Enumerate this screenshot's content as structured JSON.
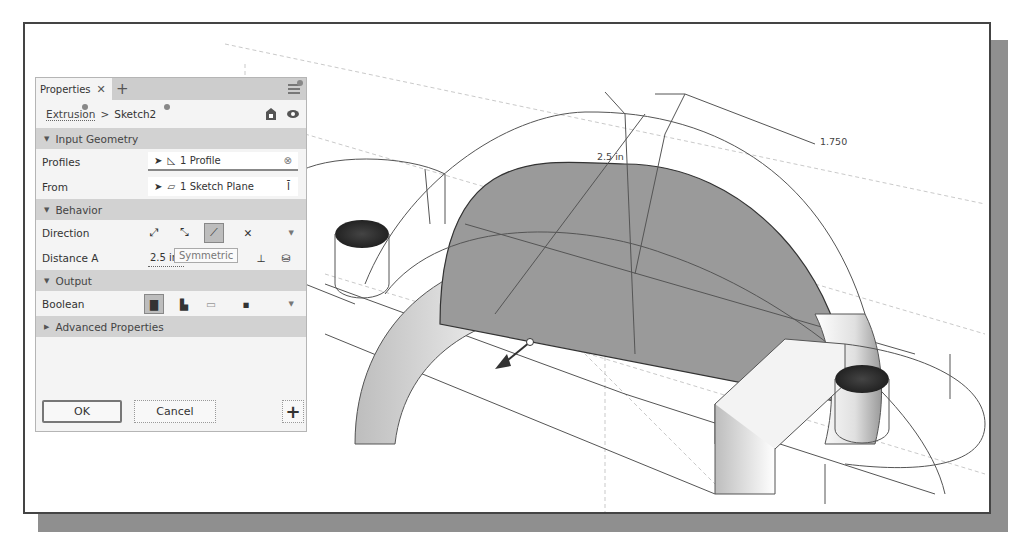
{
  "panel": {
    "tab_title": "Properties",
    "tab_close": "✕",
    "tab_add": "+",
    "breadcrumb": {
      "parent": "Extrusion",
      "separator": ">",
      "current": "Sketch2"
    },
    "sections": {
      "input_geometry": {
        "title": "Input Geometry",
        "profiles": {
          "label": "Profiles",
          "value": "1 Profile"
        },
        "from": {
          "label": "From",
          "value": "1 Sketch Plane"
        }
      },
      "behavior": {
        "title": "Behavior",
        "direction": {
          "label": "Direction",
          "options": [
            "default",
            "flipped",
            "symmetric",
            "asymmetric"
          ],
          "selected": "symmetric"
        },
        "distance_a": {
          "label": "Distance A",
          "value": "2.5 in",
          "tooltip": "Symmetric"
        }
      },
      "output": {
        "title": "Output",
        "boolean": {
          "label": "Boolean",
          "options": [
            "join",
            "cut",
            "intersect",
            "new-solid"
          ],
          "selected": "join"
        }
      },
      "advanced": {
        "title": "Advanced Properties"
      }
    },
    "buttons": {
      "ok": "OK",
      "cancel": "Cancel",
      "add": "+"
    }
  },
  "viewport": {
    "dimension_distance": "2.5 in",
    "dimension_radius": "1.750"
  },
  "colors": {
    "section_bg": "#d2d2d2",
    "panel_bg": "#f4f4f4",
    "profile_fill": "#9a9a9a",
    "frame_shadow": "#8f8f8f"
  }
}
